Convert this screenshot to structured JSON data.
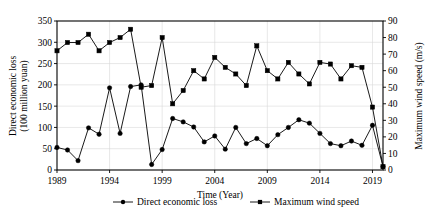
{
  "chart_data": {
    "type": "line",
    "title": "",
    "xlabel": "Time (Year)",
    "ylabel": "Direct economic loss\n(100 million yuan)",
    "y2label": "Maximum wind speed (m/s)",
    "grid": true,
    "legend_position": "bottom-center",
    "xlim": [
      1989,
      2020
    ],
    "ylim": [
      0,
      350
    ],
    "y2lim": [
      0,
      90
    ],
    "y_ticks": [
      0,
      50,
      100,
      150,
      200,
      250,
      300,
      350
    ],
    "y2_ticks": [
      0,
      10,
      20,
      30,
      40,
      50,
      60,
      70,
      80,
      90
    ],
    "x_ticks": [
      1989,
      1994,
      1999,
      2004,
      2009,
      2014,
      2019
    ],
    "x": [
      1989,
      1990,
      1991,
      1992,
      1993,
      1994,
      1995,
      1996,
      1997,
      1998,
      1999,
      2000,
      2001,
      2002,
      2003,
      2004,
      2005,
      2006,
      2007,
      2008,
      2009,
      2010,
      2011,
      2012,
      2013,
      2014,
      2015,
      2016,
      2017,
      2018,
      2019,
      2020
    ],
    "series": [
      {
        "name": "Direct economic loss",
        "axis": "left",
        "unit": "100 million yuan",
        "marker": "circle",
        "color": "#000000",
        "values": [
          53,
          47,
          22,
          99,
          84,
          193,
          86,
          196,
          200,
          13,
          48,
          121,
          113,
          101,
          66,
          80,
          49,
          100,
          62,
          74,
          57,
          83,
          100,
          118,
          110,
          86,
          62,
          57,
          68,
          58,
          105,
          8
        ]
      },
      {
        "name": "Maximum wind speed",
        "axis": "right",
        "unit": "m/s",
        "marker": "square",
        "color": "#000000",
        "values": [
          72,
          77,
          77,
          82,
          72,
          77,
          80,
          85,
          50,
          51,
          80,
          40,
          48,
          60,
          55,
          68,
          62,
          58,
          51,
          75,
          60,
          55,
          65,
          58,
          52,
          65,
          64,
          55,
          63,
          62,
          38,
          2
        ]
      }
    ]
  },
  "legend": {
    "items": [
      {
        "label": "Direct economic loss",
        "marker": "circle"
      },
      {
        "label": "Maximum wind speed",
        "marker": "square"
      }
    ]
  },
  "axes": {
    "left_title_line1": "Direct economic loss",
    "left_title_line2": "(100 million yuan)",
    "right_title": "Maximum wind speed (m/s)",
    "bottom_title": "Time (Year)"
  }
}
